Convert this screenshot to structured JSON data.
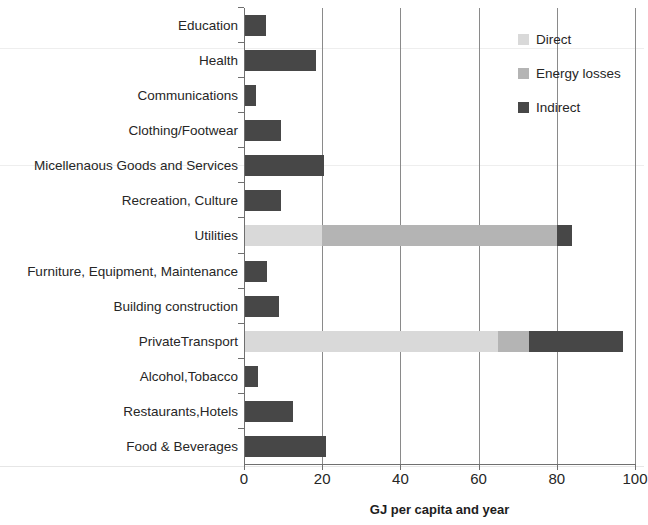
{
  "chart_data": {
    "type": "bar",
    "orientation": "horizontal",
    "stacked": true,
    "title": "",
    "xlabel": "GJ per capita and year",
    "ylabel": "",
    "xlim": [
      0,
      100
    ],
    "xticks": [
      0,
      20,
      40,
      60,
      80,
      100
    ],
    "xtick_labels": [
      "0",
      "20",
      "40",
      "60",
      "80",
      "100"
    ],
    "grid": "vertical",
    "legend_position": "top-right",
    "categories": [
      "Education",
      "Health",
      "Communications",
      "Clothing/Footwear",
      "Micellenaous Goods and Services",
      "Recreation, Culture",
      "Utilities",
      "Furniture, Equipment, Maintenance",
      "Building construction",
      "PrivateTransport",
      "Alcohol,Tobacco",
      "Restaurants,Hotels",
      "Food & Beverages"
    ],
    "series": [
      {
        "name": "Direct",
        "color": "#d9d9d9",
        "values": [
          0,
          0,
          0,
          0,
          0,
          0,
          20,
          0,
          0,
          65,
          0,
          0,
          0
        ]
      },
      {
        "name": "Energy losses",
        "color": "#b4b4b4",
        "values": [
          0,
          0,
          0,
          0,
          0,
          0,
          60,
          0,
          0,
          8,
          0,
          0,
          0
        ]
      },
      {
        "name": "Indirect",
        "color": "#474747",
        "values": [
          5.5,
          18.5,
          3,
          9.5,
          20.5,
          9.5,
          4,
          6,
          9,
          24,
          3.5,
          12.5,
          21
        ]
      }
    ],
    "totals": [
      5.5,
      18.5,
      3,
      9.5,
      20.5,
      9.5,
      84,
      6,
      9,
      97,
      3.5,
      12.5,
      21
    ]
  },
  "legend": {
    "items": [
      {
        "label": "Direct",
        "swatch": "#d9d9d9"
      },
      {
        "label": "Energy losses",
        "swatch": "#b4b4b4"
      },
      {
        "label": "Indirect",
        "swatch": "#474747"
      }
    ]
  }
}
